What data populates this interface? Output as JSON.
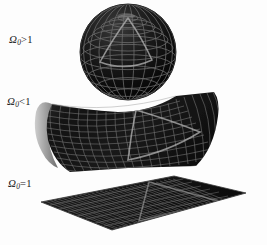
{
  "figure": {
    "background_color": "#fdfdfd",
    "width": 267,
    "height": 245
  },
  "labels": {
    "closed": {
      "symbol": "Ω",
      "subscript": "0",
      "relation": ">",
      "value": "1",
      "text": "Ω₀>1"
    },
    "open": {
      "symbol": "Ω",
      "subscript": "0",
      "relation": "<",
      "value": "1",
      "text": "Ω₀<1"
    },
    "flat": {
      "symbol": "Ω",
      "subscript": "0",
      "relation": "=",
      "value": "1",
      "text": "Ω₀=1"
    }
  },
  "surfaces": {
    "sphere": {
      "name": "closed-spherical-surface",
      "geometry": "sphere",
      "center_x": 128,
      "center_y": 52,
      "radius": 48,
      "mesh_color": "#6e6e6e",
      "fill_color": "#141414",
      "meridians": 16,
      "parallels": 11,
      "triangle_color": "#b4b4b4"
    },
    "saddle": {
      "name": "open-hyperbolic-surface",
      "geometry": "saddle",
      "mesh_color": "#767676",
      "fill_color": "#161616",
      "underside_color": "#8d8d8d",
      "rows": 15,
      "cols": 22,
      "triangle_color": "#bdbdbd"
    },
    "plane": {
      "name": "flat-euclidean-surface",
      "geometry": "plane",
      "mesh_color": "#7b7b7b",
      "fill_color": "#191919",
      "rows": 9,
      "cols": 38,
      "triangle_color": "#9a9a9a"
    }
  },
  "colors": {
    "background": "#fdfdfd",
    "label_text": "#1a1a1a",
    "dark_fill": "#141414",
    "grid_line": "#6e6e6e",
    "highlight_triangle": "#b8b8b8"
  }
}
